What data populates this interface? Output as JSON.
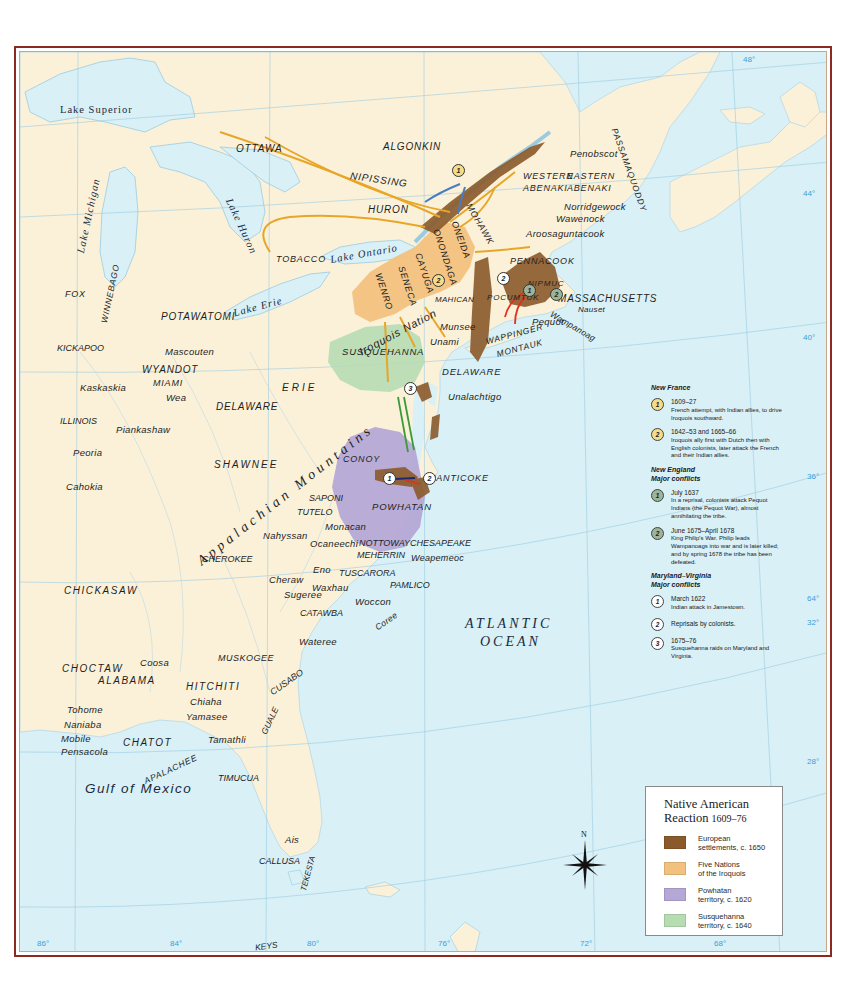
{
  "map": {
    "title": "Native American Reaction",
    "title_years": "1609–76",
    "colors": {
      "land": "#fbf1d9",
      "water": "#d8f0f6",
      "frame": "#8a2a22",
      "european": "#8b5a2b",
      "iroquois": "#f2c17e",
      "powhatan": "#b5a8d6",
      "susquehanna": "#b6dcb2",
      "arrow_orange": "#e8a628",
      "arrow_blue": "#4a7cc0",
      "arrow_red": "#e03020",
      "arrow_green": "#3a9a3a",
      "gridline": "#9ccbe0",
      "coord_text": "#3aa0d8"
    },
    "water_labels": {
      "lake_superior": "Lake Superior",
      "lake_michigan": "Lake Michigan",
      "lake_huron": "Lake Huron",
      "lake_ontario": "Lake Ontario",
      "lake_erie": "Lake Erie",
      "atlantic_1": "ATLANTIC",
      "atlantic_2": "OCEAN",
      "gulf": "Gulf of Mexico"
    },
    "mountains": "Appalachian Mountains",
    "iroquois_nation": "Iroquois Nation",
    "tribes": {
      "ottawa": "OTTAWA",
      "algonkin": "ALGONKIN",
      "nipissing": "NIPISSING",
      "huron": "HURON",
      "tobacco": "TOBACCO",
      "mohawk": "MOHAWK",
      "oneida": "ONEIDA",
      "onondaga": "ONONDAGA",
      "cayuga": "CAYUGA",
      "seneca": "SENECA",
      "wenro": "WENRO",
      "mahican": "MAHICAN",
      "munsee": "Munsee",
      "unami": "Unami",
      "susquehanna": "SUSQUEHANNA",
      "delaware_east": "DELAWARE",
      "unalachtigo": "Unalachtigo",
      "western_abenaki_1": "WESTERN",
      "western_abenaki_2": "ABENAKI",
      "eastern_abenaki_1": "EASTERN",
      "eastern_abenaki_2": "ABENAKI",
      "penobscot": "Penobscot",
      "passamaquoddy": "PASSAMAQUODDY",
      "norridgewock": "Norridgewock",
      "wawenock": "Wawenock",
      "aroosaguntacook": "Aroosaguntacook",
      "pennacook": "PENNACOOK",
      "nipmuc": "NIPMUC",
      "pocumtuk": "POCUMTUK",
      "massachusetts": "MASSACHUSETTS",
      "nauset": "Nauset",
      "wampanoag": "Wampanoag",
      "pequot": "Pequot",
      "wappinger": "WAPPINGER",
      "montauk": "MONTAUK",
      "fox": "FOX",
      "winnebago": "WINNEBAGO",
      "potawatomi": "POTAWATOMI",
      "kickapoo": "KICKAPOO",
      "mascouten": "Mascouten",
      "wyandot": "WYANDOT",
      "miami": "MIAMI",
      "wea": "Wea",
      "kaskaskia": "Kaskaskia",
      "erie": "ERIE",
      "delaware_west": "DELAWARE",
      "illinois": "ILLINOIS",
      "piankashaw": "Piankashaw",
      "peoria": "Peoria",
      "cahokia": "Cahokia",
      "shawnee": "SHAWNEE",
      "conoy": "CONOY",
      "nanticoke": "NANTICOKE",
      "saponi": "SAPONI",
      "tutelo": "TUTELO",
      "powhatan": "POWHATAN",
      "monacan": "Monacan",
      "nahyssan": "Nahyssan",
      "ocaneechi": "Ocaneechi",
      "nottoway": "NOTTOWAY",
      "chesapeake": "CHESAPEAKE",
      "meherrin": "MEHERRIN",
      "weapemeoc": "Weapemeoc",
      "cherokee": "CHEROKEE",
      "eno": "Eno",
      "tuscarora": "TUSCARORA",
      "cheraw": "Cheraw",
      "pamlico": "PAMLICO",
      "chickasaw": "CHICKASAW",
      "sugeree": "Sugeree",
      "waxhau": "Waxhau",
      "woccon": "Woccon",
      "catawba": "CATAWBA",
      "coree": "Coree",
      "wateree": "Wateree",
      "choctaw": "CHOCTAW",
      "coosa": "Coosa",
      "muskogee": "MUSKOGEE",
      "alabama": "ALABAMA",
      "cusabo": "CUSABO",
      "hitchiti": "HITCHITI",
      "chiaha": "Chiaha",
      "tohome": "Tohome",
      "yamasee": "Yamasee",
      "guale": "GUALE",
      "naniaba": "Naniaba",
      "mobile": "Mobile",
      "chatot": "CHATOT",
      "tamathli": "Tamathli",
      "pensacola": "Pensacola",
      "apalachee": "APALACHEE",
      "timucua": "TIMUCUA",
      "ais": "Ais",
      "callusa": "CALLUSA",
      "tekesta": "TEKESTA",
      "keys": "KEYS"
    },
    "coordinates": {
      "lat_48": "48°",
      "lat_44": "44°",
      "lat_40": "40°",
      "lat_36": "36°",
      "lat_64": "64°",
      "lat_32": "32°",
      "lat_28": "28°",
      "lon_86": "86°",
      "lon_84": "84°",
      "lon_80": "80°",
      "lon_76": "76°",
      "lon_72": "72°",
      "lon_68": "68°"
    },
    "markers": {
      "nf1": "1",
      "nf2": "2",
      "ne1": "1",
      "ne2": "2",
      "mv1": "1",
      "mv2": "2",
      "mv3": "3"
    },
    "compass_label": "N"
  },
  "notes": {
    "new_france": {
      "heading": "New France",
      "items": [
        {
          "num": "1",
          "date": "1609–27",
          "text": "French attempt, with Indian allies, to drive Iroquois southward."
        },
        {
          "num": "2",
          "date": "1642–53 and 1665–66",
          "text": "Iroquois ally first with Dutch then with English colonists, later attack the French and their Indian allies."
        }
      ]
    },
    "new_england": {
      "heading_1": "New England",
      "heading_2": "Major conflicts",
      "items": [
        {
          "num": "1",
          "date": "July 1637",
          "text": "In a reprisal, colonists attack Pequot Indians (the Pequot War), almost annihilating the tribe."
        },
        {
          "num": "2",
          "date": "June 1675–April 1678",
          "text": "King Philip's War. Philip leads Wampanoags into war and is later killed; and by spring 1678 the tribe has been defeated."
        }
      ]
    },
    "maryland_virginia": {
      "heading_1": "Maryland–Virginia",
      "heading_2": "Major conflicts",
      "items": [
        {
          "num": "1",
          "date": "March 1622",
          "text": "Indian attack in Jamestown."
        },
        {
          "num": "2",
          "date": "",
          "text": "Reprisals by colonists."
        },
        {
          "num": "3",
          "date": "1675–76",
          "text": "Susquehanna raids on Maryland and Virginia."
        }
      ]
    }
  },
  "legend": {
    "title": "Native American",
    "title_2": "Reaction",
    "years": "1609–76",
    "items": [
      {
        "label_1": "European",
        "label_2": "settlements, c. 1650",
        "color": "#8b5a2b"
      },
      {
        "label_1": "Five Nations",
        "label_2": "of the Iroquois",
        "color": "#f2c17e"
      },
      {
        "label_1": "Powhatan",
        "label_2": "territory, c. 1620",
        "color": "#b5a8d6"
      },
      {
        "label_1": "Susquehanna",
        "label_2": "territory, c. 1640",
        "color": "#b6dcb2"
      }
    ]
  }
}
